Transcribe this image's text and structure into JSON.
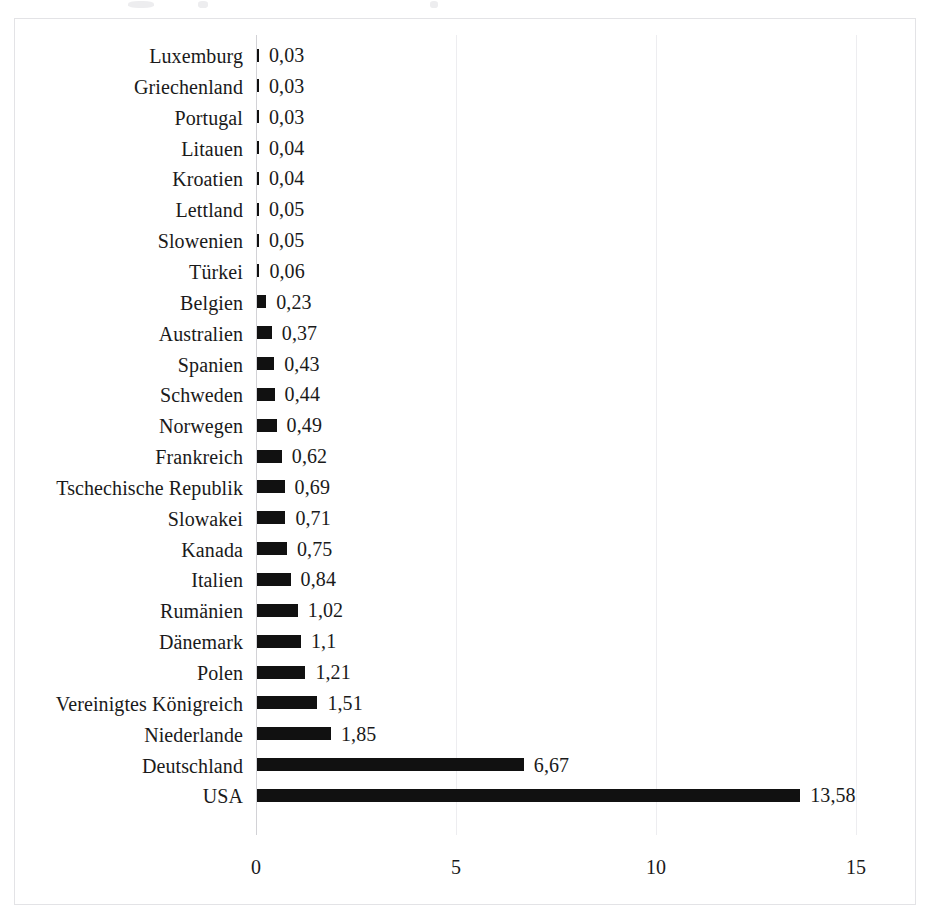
{
  "figure": {
    "background_color": "#ffffff",
    "frame_color": "#e3e3e6",
    "bar_color": "#111111",
    "gridline_color": "#ededf0",
    "axis_color": "#d2d2d6"
  },
  "chart_data": {
    "type": "bar",
    "orientation": "horizontal",
    "title": "",
    "subtitle": "",
    "xlabel": "",
    "ylabel": "",
    "xlim": [
      0,
      15
    ],
    "xticks": [
      "0",
      "5",
      "10",
      "15"
    ],
    "xtick_values": [
      0,
      5,
      10,
      15
    ],
    "grid": "vertical",
    "legend": "none",
    "decimal_separator": ",",
    "categories": [
      "Luxemburg",
      "Griechenland",
      "Portugal",
      "Litauen",
      "Kroatien",
      "Lettland",
      "Slowenien",
      "Türkei",
      "Belgien",
      "Australien",
      "Spanien",
      "Schweden",
      "Norwegen",
      "Frankreich",
      "Tschechische Republik",
      "Slowakei",
      "Kanada",
      "Italien",
      "Rumänien",
      "Dänemark",
      "Polen",
      "Vereinigtes Königreich",
      "Niederlande",
      "Deutschland",
      "USA"
    ],
    "values": [
      0.03,
      0.03,
      0.03,
      0.04,
      0.04,
      0.05,
      0.05,
      0.06,
      0.23,
      0.37,
      0.43,
      0.44,
      0.49,
      0.62,
      0.69,
      0.71,
      0.75,
      0.84,
      1.02,
      1.1,
      1.21,
      1.51,
      1.85,
      6.67,
      13.58
    ],
    "data_labels": [
      "0,03",
      "0,03",
      "0,03",
      "0,04",
      "0,04",
      "0,05",
      "0,05",
      "0,06",
      "0,23",
      "0,37",
      "0,43",
      "0,44",
      "0,49",
      "0,62",
      "0,69",
      "0,71",
      "0,75",
      "0,84",
      "1,02",
      "1,1",
      "1,21",
      "1,51",
      "1,85",
      "6,67",
      "13,58"
    ]
  }
}
